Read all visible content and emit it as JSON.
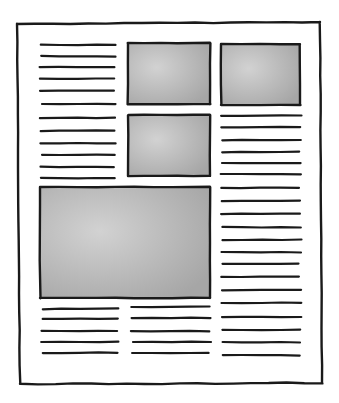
{
  "diagram": {
    "colors": {
      "ink": "#1a1a1a",
      "paper": "#ffffff",
      "image_fill": "#a9a9a9",
      "image_fill_light": "#cfcfcf"
    },
    "page": {
      "x1": 17,
      "y1": 23,
      "x2": 322,
      "y2": 383
    },
    "images": [
      {
        "name": "image-top-middle",
        "x": 128,
        "y": 43,
        "w": 82,
        "h": 61
      },
      {
        "name": "image-top-right",
        "x": 221,
        "y": 44,
        "w": 79,
        "h": 61
      },
      {
        "name": "image-middle",
        "x": 128,
        "y": 115,
        "w": 82,
        "h": 61
      },
      {
        "name": "image-large",
        "x": 40,
        "y": 187,
        "w": 170,
        "h": 111
      }
    ],
    "text_columns": [
      {
        "name": "text-block-left-top",
        "x1": 41,
        "x2": 115,
        "ys": [
          45,
          56,
          67,
          79,
          91,
          104,
          118,
          131,
          143,
          155,
          167,
          178
        ]
      },
      {
        "name": "text-block-right",
        "x1": 222,
        "x2": 300,
        "ys": [
          116,
          127,
          140,
          152,
          163,
          174,
          188,
          201,
          214,
          227,
          240,
          252,
          264,
          277,
          290,
          303,
          317,
          330,
          342,
          355
        ]
      },
      {
        "name": "text-block-left-bottom",
        "x1": 42,
        "x2": 117,
        "ys": [
          309,
          319,
          331,
          342,
          353
        ]
      },
      {
        "name": "text-block-middle-bottom",
        "x1": 132,
        "x2": 210,
        "ys": [
          307,
          318,
          331,
          342,
          353
        ]
      }
    ]
  }
}
